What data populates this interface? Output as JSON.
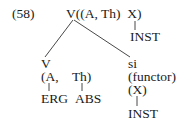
{
  "example_number": "(58)",
  "root": {
    "label": "V((A, Th)  X)",
    "x_child": "INST"
  },
  "left_branch": {
    "head": "V",
    "args": "(A,    Th)",
    "arg_a_case": "ERG",
    "arg_th_case": "ABS"
  },
  "right_branch": {
    "head": "si",
    "role": "(functor)",
    "arg": "(X)",
    "arg_case": "INST"
  }
}
